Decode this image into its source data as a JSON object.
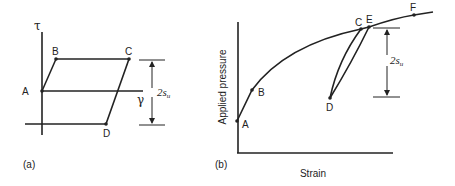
{
  "panel_a": {
    "caption": "(a)",
    "y_axis_label": "τ",
    "x_axis_label": "γ",
    "points": {
      "A": "A",
      "B": "B",
      "C": "C",
      "D": "D"
    },
    "dimension": {
      "main": "2s",
      "sub": "u"
    }
  },
  "panel_b": {
    "caption": "(b)",
    "y_axis_label": "Applied pressure",
    "x_axis_label": "Strain",
    "points": {
      "A": "A",
      "B": "B",
      "C": "C",
      "D": "D",
      "E": "E",
      "F": "F"
    },
    "dimension": {
      "main": "2s",
      "sub": "u"
    }
  },
  "colors": {
    "line": "#222222",
    "background": "#ffffff"
  }
}
